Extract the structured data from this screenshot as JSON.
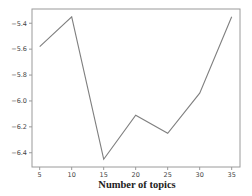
{
  "chart_data": {
    "type": "line",
    "title": "",
    "xlabel": "Number of topics",
    "ylabel": "",
    "x": [
      5,
      10,
      15,
      20,
      25,
      30,
      35
    ],
    "series": [
      {
        "name": "score",
        "values": [
          -5.58,
          -5.35,
          -6.45,
          -6.11,
          -6.25,
          -5.94,
          -5.35
        ],
        "color": "#7f7f7f"
      }
    ],
    "xticks": [
      5,
      10,
      15,
      20,
      25,
      30,
      35
    ],
    "xtick_labels": [
      "5",
      "10",
      "15",
      "20",
      "25",
      "30",
      "35"
    ],
    "yticks": [
      -5.4,
      -5.6,
      -5.8,
      -6.0,
      -6.2,
      -6.4
    ],
    "ytick_labels": [
      "-5.4",
      "-5.6",
      "-5.8",
      "-6.0",
      "-6.2",
      "-6.4"
    ],
    "xlim": [
      3.8,
      36.3
    ],
    "ylim": [
      -6.51,
      -5.29
    ],
    "grid": false,
    "legend": null
  }
}
